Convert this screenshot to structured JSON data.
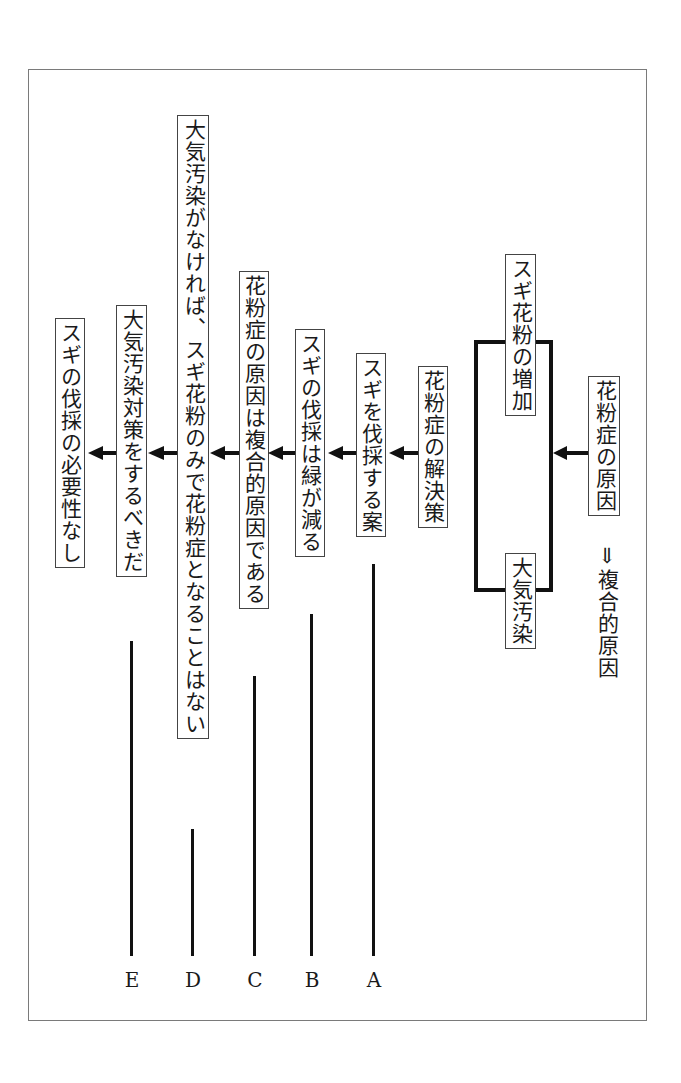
{
  "diagram": {
    "root": {
      "label": "花粉症の原因",
      "sublabel": "⇓複合的原因"
    },
    "causes": [
      {
        "label": "スギ花粉の増加"
      },
      {
        "label": "大気汚染"
      }
    ],
    "chain": [
      {
        "id": "solution",
        "label": "花粉症の解決策"
      },
      {
        "id": "A_box",
        "label": "スギを伐採する案"
      },
      {
        "id": "B_box",
        "label": "スギの伐採は緑が減る"
      },
      {
        "id": "C_box",
        "label": "花粉症の原因は複合的原因である"
      },
      {
        "id": "D_box",
        "label": "大気汚染がなければ、スギ花粉のみで花粉症となることはない"
      },
      {
        "id": "E_box",
        "label": "大気汚染対策をするべきだ"
      },
      {
        "id": "conclusion",
        "label": "スギの伐採の必要性なし"
      }
    ],
    "markers": [
      {
        "letter": "E"
      },
      {
        "letter": "D"
      },
      {
        "letter": "C"
      },
      {
        "letter": "B"
      },
      {
        "letter": "A"
      }
    ]
  }
}
